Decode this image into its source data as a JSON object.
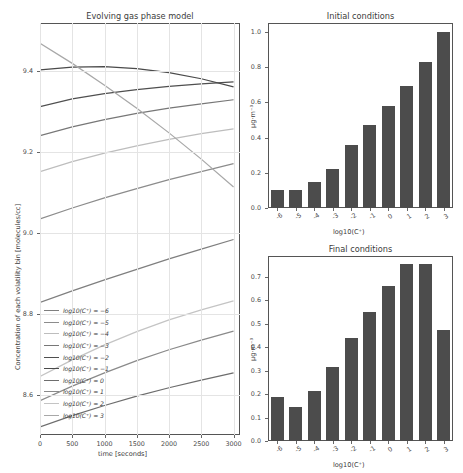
{
  "figure": {
    "width": 463,
    "height": 473,
    "background": "#ffffff",
    "bar_color": "#4c4c4c",
    "grid_color": "#e4e4e4",
    "axis_color": "#555555"
  },
  "left_panel": {
    "title": "Evolving gas phase model",
    "xlabel": "time [seconds]",
    "ylabel": "Concentration of each volatility bin [molecules/cc]",
    "xticks": [
      "0",
      "500",
      "1000",
      "1500",
      "2000",
      "2500",
      "3000"
    ],
    "yticks": [
      "8.6",
      "8.8",
      "9.0",
      "9.2",
      "9.4"
    ],
    "legend": [
      {
        "label": "log10(C⁺) = −6",
        "color": "#7f7f7f"
      },
      {
        "label": "log10(C⁺) = −5",
        "color": "#8c8c8c"
      },
      {
        "label": "log10(C⁺) = −4",
        "color": "#bdbdbd"
      },
      {
        "label": "log10(C⁺) = −3",
        "color": "#777777"
      },
      {
        "label": "log10(C⁺) = −2",
        "color": "#4f4f4f"
      },
      {
        "label": "log10(C⁺) = −1",
        "color": "#4a4a4a"
      },
      {
        "label": "log10(C⁺) = 0",
        "color": "#6d6d6d"
      },
      {
        "label": "log10(C⁺) = 1",
        "color": "#8a8a8a"
      },
      {
        "label": "log10(C⁺) = 2",
        "color": "#c4c4c4"
      },
      {
        "label": "log10(C⁺) = 3",
        "color": "#a8a8a8"
      }
    ]
  },
  "top_right_panel": {
    "title": "Initial conditions",
    "xlabel": "log10(C⁺)",
    "ylabel": "μg·m⁻³",
    "yticks": [
      "0.0",
      "0.2",
      "0.4",
      "0.6",
      "0.8",
      "1.0"
    ]
  },
  "bottom_right_panel": {
    "title": "Final conditions",
    "xlabel": "log10(C⁺)",
    "ylabel": "μg·m⁻³",
    "yticks": [
      "0.0",
      "0.1",
      "0.2",
      "0.3",
      "0.4",
      "0.5",
      "0.6",
      "0.7"
    ]
  },
  "chart_data": [
    {
      "type": "line",
      "title": "Evolving gas phase model",
      "xlabel": "time [seconds]",
      "ylabel": "Concentration of each volatility bin [molecules/cc]",
      "xlim": [
        0,
        3100
      ],
      "ylim": [
        8.5,
        9.52
      ],
      "grid": true,
      "legend_position": "lower-left",
      "x": [
        0,
        500,
        1000,
        1500,
        2000,
        2500,
        3000
      ],
      "series": [
        {
          "name": "log10(C*) = -6",
          "color": "#7f7f7f",
          "values": [
            8.828,
            8.857,
            8.884,
            8.91,
            8.936,
            8.96,
            8.984
          ]
        },
        {
          "name": "log10(C*) = -5",
          "color": "#8c8c8c",
          "values": [
            9.035,
            9.062,
            9.087,
            9.11,
            9.132,
            9.152,
            9.172
          ]
        },
        {
          "name": "log10(C*) = -4",
          "color": "#bdbdbd",
          "values": [
            9.152,
            9.177,
            9.198,
            9.216,
            9.232,
            9.246,
            9.258
          ]
        },
        {
          "name": "log10(C*) = -3",
          "color": "#777777",
          "values": [
            9.241,
            9.263,
            9.281,
            9.296,
            9.309,
            9.32,
            9.33
          ]
        },
        {
          "name": "log10(C*) = -2",
          "color": "#4f4f4f",
          "values": [
            9.313,
            9.332,
            9.345,
            9.355,
            9.363,
            9.369,
            9.374
          ]
        },
        {
          "name": "log10(C*) = -1",
          "color": "#4a4a4a",
          "values": [
            9.404,
            9.411,
            9.412,
            9.407,
            9.397,
            9.382,
            9.362
          ]
        },
        {
          "name": "log10(C*) = 0",
          "color": "#6d6d6d",
          "values": [
            8.52,
            8.548,
            8.573,
            8.596,
            8.617,
            8.636,
            8.654
          ]
        },
        {
          "name": "log10(C*) = 1",
          "color": "#8a8a8a",
          "values": [
            8.585,
            8.621,
            8.654,
            8.684,
            8.711,
            8.735,
            8.757
          ]
        },
        {
          "name": "log10(C*) = 2",
          "color": "#c4c4c4",
          "values": [
            8.645,
            8.686,
            8.723,
            8.756,
            8.785,
            8.81,
            8.832
          ]
        },
        {
          "name": "log10(C*) = 3",
          "color": "#a8a8a8",
          "values": [
            9.47,
            9.42,
            9.366,
            9.309,
            9.248,
            9.183,
            9.114
          ]
        }
      ]
    },
    {
      "type": "bar",
      "title": "Initial conditions",
      "xlabel": "log10(C*)",
      "ylabel": "μg·m⁻³",
      "categories": [
        "-6",
        "-5",
        "-4",
        "-3",
        "-2",
        "-1",
        "0",
        "1",
        "2",
        "3"
      ],
      "values": [
        0.1,
        0.1,
        0.15,
        0.22,
        0.36,
        0.47,
        0.58,
        0.69,
        0.83,
        1.0
      ],
      "ylim": [
        0.0,
        1.05
      ],
      "grid": false
    },
    {
      "type": "bar",
      "title": "Final conditions",
      "xlabel": "log10(C*)",
      "ylabel": "μg·m⁻³",
      "categories": [
        "-6",
        "-5",
        "-4",
        "-3",
        "-2",
        "-1",
        "0",
        "1",
        "2",
        "3"
      ],
      "values": [
        0.19,
        0.145,
        0.215,
        0.315,
        0.44,
        0.55,
        0.66,
        0.755,
        0.755,
        0.475
      ],
      "ylim": [
        0.0,
        0.79
      ],
      "grid": false
    }
  ]
}
